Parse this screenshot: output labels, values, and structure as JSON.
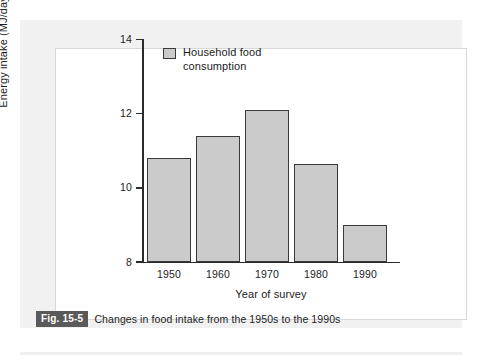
{
  "figure": {
    "caption_badge": "Fig. 15-5",
    "caption_text": "Changes in food intake from the 1950s to the 1990s"
  },
  "legend": {
    "swatch_name": "legend-swatch-household-food",
    "label": "Household food consumption"
  },
  "colors": {
    "bar_fill": "#cbcbcb",
    "bar_edge": "#3a3a3a",
    "axis": "#2b2b2b",
    "panel_background": "#f1f1f1",
    "card_background": "#ffffff",
    "caption_badge_background": "#5a5a5a",
    "text": "#1c1c1c"
  },
  "chart_data": {
    "type": "bar",
    "title": "",
    "subtitle": "",
    "xlabel": "Year of survey",
    "ylabel": "Energy intake (MJ/day)",
    "categories": [
      "1950",
      "1960",
      "1970",
      "1980",
      "1990"
    ],
    "values": [
      10.8,
      11.4,
      12.1,
      10.65,
      9.0
    ],
    "series": [
      {
        "name": "Household food consumption",
        "values": [
          10.8,
          11.4,
          12.1,
          10.65,
          9.0
        ]
      }
    ],
    "ylim": [
      8,
      14
    ],
    "yticks": [
      8,
      10,
      12,
      14
    ],
    "ytick_labels": [
      "8",
      "10",
      "12",
      "14"
    ],
    "xtick_labels": [
      "1950",
      "1960",
      "1970",
      "1980",
      "1990"
    ],
    "grid": false,
    "legend_position": "top-left-inside",
    "annotations": []
  }
}
